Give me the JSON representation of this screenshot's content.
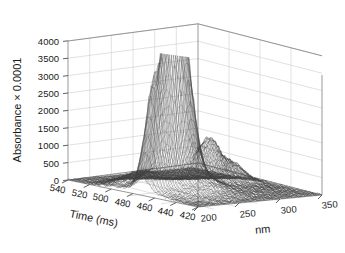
{
  "chart_data": {
    "type": "surface",
    "title": "",
    "zlabel": "Absorbance × 0.0001",
    "xlabel": "Time (ms)",
    "ylabel": "nm",
    "zticks": [
      0,
      500,
      1000,
      1500,
      2000,
      2500,
      3000,
      3500,
      4000
    ],
    "ztick_labels": [
      "0",
      "500",
      "1000",
      "1500",
      "2000",
      "2500",
      "3000",
      "3500",
      "4000"
    ],
    "zlim": [
      0,
      4200
    ],
    "xticks": [
      540,
      520,
      500,
      480,
      460,
      440,
      420
    ],
    "xtick_labels": [
      "540",
      "520",
      "500",
      "480",
      "460",
      "440",
      "420"
    ],
    "xlim": [
      420,
      545
    ],
    "yticks": [
      200,
      250,
      300,
      350
    ],
    "ytick_labels": [
      "200",
      "250",
      "300",
      "350"
    ],
    "ylim": [
      190,
      360
    ],
    "grid": true,
    "legend": "none",
    "mesh_color": "#3a3a3a",
    "grid_color": "#cccccc",
    "axis_color": "#808080",
    "background": "#ffffff",
    "peaks": [
      {
        "time_ms": 487,
        "nm": 228,
        "absorbance": 4050
      },
      {
        "time_ms": 470,
        "nm": 252,
        "absorbance": 3780
      },
      {
        "time_ms": 478,
        "nm": 212,
        "absorbance": 2600
      },
      {
        "time_ms": 462,
        "nm": 305,
        "absorbance": 1150
      }
    ],
    "baseline_noise": 60
  },
  "axes": {
    "z_title": "Absorbance × 0.0001",
    "x_title": "Time (ms)",
    "y_title": "nm"
  }
}
